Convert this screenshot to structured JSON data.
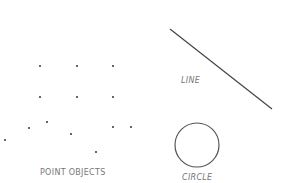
{
  "labels": {
    "points": "POINT  OBJECTS",
    "line": "LINE",
    "circle": "CIRCLE"
  },
  "points": [
    [
      40,
      66
    ],
    [
      77,
      66
    ],
    [
      113,
      66
    ],
    [
      40,
      97
    ],
    [
      77,
      97
    ],
    [
      113,
      97
    ],
    [
      29,
      128
    ],
    [
      47,
      122
    ],
    [
      113,
      127
    ],
    [
      131,
      127
    ],
    [
      71,
      134
    ],
    [
      5,
      140
    ],
    [
      96,
      152
    ]
  ],
  "line": {
    "x1": 170,
    "y1": 29,
    "x2": 272,
    "y2": 109
  },
  "circle": {
    "cx": 197,
    "cy": 145,
    "r": 22
  }
}
